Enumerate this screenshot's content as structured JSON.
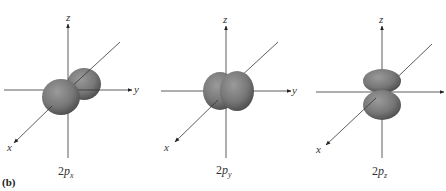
{
  "figure": {
    "part_label": "(b)",
    "lobe_color": "#7a7a7a",
    "axis_color": "#333333",
    "panels": [
      {
        "id": "2px",
        "label_prefix": "2",
        "label_p": "p",
        "label_sub": "x",
        "axes": {
          "z": "z",
          "y": "y",
          "x": "x"
        }
      },
      {
        "id": "2py",
        "label_prefix": "2",
        "label_p": "p",
        "label_sub": "y",
        "axes": {
          "z": "z",
          "y": "y",
          "x": "x"
        }
      },
      {
        "id": "2pz",
        "label_prefix": "2",
        "label_p": "p",
        "label_sub": "z",
        "axes": {
          "z": "z",
          "y": "",
          "x": "x"
        }
      }
    ]
  }
}
